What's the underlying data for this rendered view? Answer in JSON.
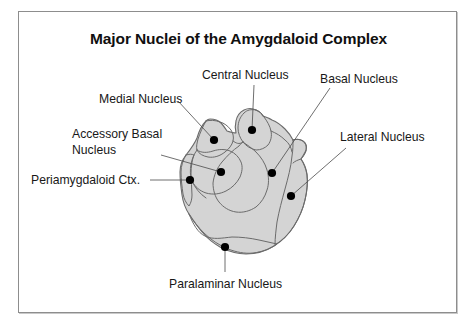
{
  "figure": {
    "title": "Major Nuclei of the Amygdaloid Complex",
    "background_color": "#ffffff",
    "frame_color": "#8d8d8d",
    "structure_fill_color": "#d4d4d4",
    "structure_outline_color": "#6b6b6b",
    "marker_color": "#000000",
    "leader_line_color": "#4a4a4a"
  },
  "labels": {
    "central_nucleus": "Central Nucleus",
    "basal_nucleus": "Basal Nucleus",
    "medial_nucleus": "Medial Nucleus",
    "accessory_basal_line1": "Accessory Basal",
    "accessory_basal_line2": "Nucleus",
    "lateral_nucleus": "Lateral Nucleus",
    "periamygdaloid_ctx": "Periamygdaloid Ctx.",
    "paralaminar_nucleus": "Paralaminar Nucleus"
  }
}
